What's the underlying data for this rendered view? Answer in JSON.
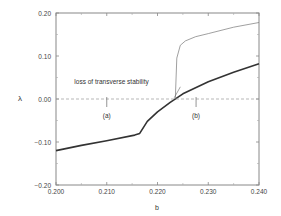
{
  "chart_data": {
    "type": "line",
    "title": "",
    "xlabel": "b",
    "ylabel": "λ",
    "xlim": [
      0.2,
      0.24
    ],
    "ylim": [
      -0.2,
      0.2
    ],
    "xticks": [
      "0.200",
      "0.210",
      "0.220",
      "0.230",
      "0.240"
    ],
    "yticks": [
      "0.20",
      "0.10",
      "0.00",
      "−0.10",
      "−0.20"
    ],
    "grid": false,
    "legend": null,
    "series": [
      {
        "name": "main exponent (thick)",
        "style": "thick solid",
        "x": [
          0.2,
          0.205,
          0.21,
          0.2155,
          0.2165,
          0.218,
          0.22,
          0.2225,
          0.225,
          0.23,
          0.235,
          0.24
        ],
        "y": [
          -0.12,
          -0.108,
          -0.097,
          -0.084,
          -0.08,
          -0.052,
          -0.03,
          -0.008,
          0.012,
          0.04,
          0.062,
          0.082
        ]
      },
      {
        "name": "transverse exponent (thin)",
        "style": "thin solid",
        "x": [
          0.2235,
          0.2238,
          0.2245,
          0.2255,
          0.2275,
          0.23,
          0.235,
          0.24
        ],
        "y": [
          0.0,
          0.095,
          0.125,
          0.135,
          0.145,
          0.152,
          0.167,
          0.178
        ]
      },
      {
        "name": "zero reference",
        "style": "dashed",
        "x": [
          0.2,
          0.24
        ],
        "y": [
          0.0,
          0.0
        ]
      }
    ],
    "annotations": [
      {
        "text": "loss of transverse stability",
        "x": 0.2115,
        "y": 0.04,
        "arrow_to": [
          0.2233,
          0.003
        ]
      },
      {
        "text": "(a)",
        "x": 0.21,
        "y": -0.04,
        "marker_x": 0.21
      },
      {
        "text": "(b)",
        "x": 0.2276,
        "y": -0.04,
        "marker_x": 0.2276
      }
    ]
  }
}
